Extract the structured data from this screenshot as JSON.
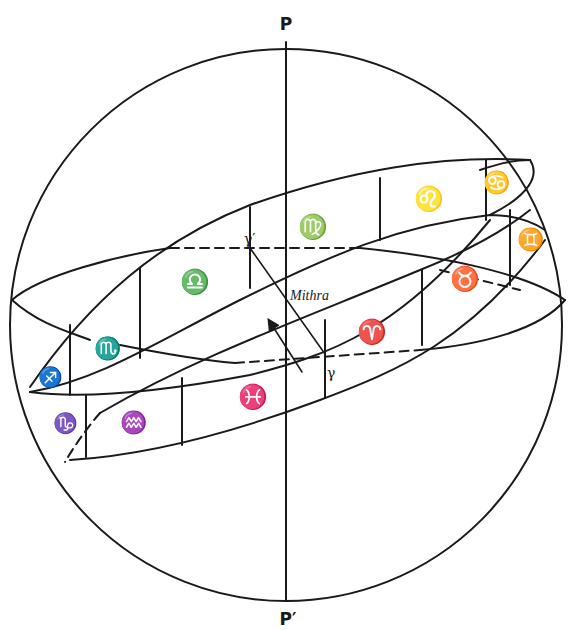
{
  "figure": {
    "poles": {
      "north": "P",
      "south": "P′"
    },
    "annotation": "Mithra",
    "equinox_markers": {
      "old": "γ",
      "new": "γ′"
    },
    "zodiac_signs": [
      {
        "name": "cancer",
        "glyph": "♋"
      },
      {
        "name": "leo",
        "glyph": "♌"
      },
      {
        "name": "virgo",
        "glyph": "♍"
      },
      {
        "name": "libra",
        "glyph": "♎"
      },
      {
        "name": "scorpio",
        "glyph": "♏"
      },
      {
        "name": "sagittarius",
        "glyph": "♐"
      },
      {
        "name": "capricorn",
        "glyph": "♑"
      },
      {
        "name": "aquarius",
        "glyph": "♒"
      },
      {
        "name": "pisces",
        "glyph": "♓"
      },
      {
        "name": "aries",
        "glyph": "♈"
      },
      {
        "name": "taurus",
        "glyph": "♉"
      },
      {
        "name": "gemini",
        "glyph": "♊"
      }
    ],
    "colors": {
      "ink": "#1a1a1a",
      "paper": "#ffffff"
    }
  }
}
